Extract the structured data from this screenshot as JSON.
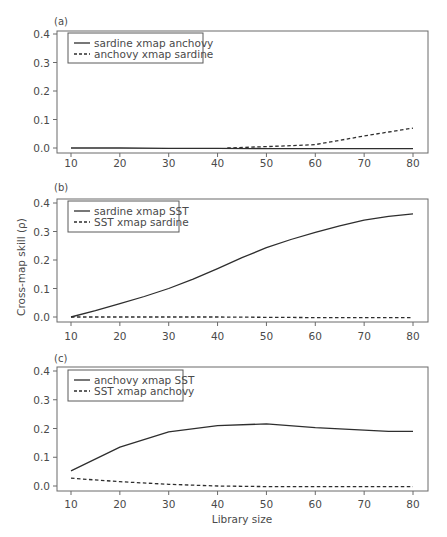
{
  "figure": {
    "ylabel": "Cross-map skill (ρ)",
    "xlabel": "Library size"
  },
  "colors": {
    "line": "#2e2e2e",
    "frame": "#6a6a6a",
    "text": "#4a4a4a"
  },
  "chart_data": [
    {
      "type": "line",
      "panel_label": "(a)",
      "title": "",
      "xlabel": "",
      "ylabel": "",
      "xlim": [
        10,
        80
      ],
      "ylim": [
        0,
        0.4
      ],
      "x_ticks": [
        10,
        20,
        30,
        40,
        50,
        60,
        70,
        80
      ],
      "y_ticks": [
        "0.0",
        "0.1",
        "0.2",
        "0.3",
        "0.4"
      ],
      "grid": false,
      "legend_position": "upper left",
      "series": [
        {
          "name": "sardine xmap anchovy",
          "style": "solid",
          "x": [
            10,
            20,
            30,
            40,
            50,
            60,
            70,
            80
          ],
          "y": [
            0.0,
            0.0,
            -0.001,
            -0.001,
            -0.002,
            -0.002,
            -0.002,
            -0.002
          ]
        },
        {
          "name": "anchovy xmap sardine",
          "style": "dashed",
          "x": [
            42,
            50,
            55,
            60,
            65,
            70,
            75,
            80
          ],
          "y": [
            0.0,
            0.005,
            0.008,
            0.012,
            0.027,
            0.042,
            0.056,
            0.07
          ]
        }
      ]
    },
    {
      "type": "line",
      "panel_label": "(b)",
      "title": "",
      "xlabel": "",
      "ylabel": "Cross-map skill (ρ)",
      "xlim": [
        10,
        80
      ],
      "ylim": [
        0,
        0.4
      ],
      "x_ticks": [
        10,
        20,
        30,
        40,
        50,
        60,
        70,
        80
      ],
      "y_ticks": [
        "0.0",
        "0.1",
        "0.2",
        "0.3",
        "0.4"
      ],
      "grid": false,
      "legend_position": "upper left",
      "series": [
        {
          "name": "sardine xmap SST",
          "style": "solid",
          "x": [
            10,
            15,
            20,
            25,
            30,
            35,
            40,
            45,
            50,
            55,
            60,
            65,
            70,
            75,
            80
          ],
          "y": [
            0.0,
            0.022,
            0.047,
            0.072,
            0.1,
            0.133,
            0.17,
            0.208,
            0.243,
            0.272,
            0.297,
            0.32,
            0.34,
            0.353,
            0.362
          ]
        },
        {
          "name": "SST xmap sardine",
          "style": "dashed",
          "x": [
            10,
            20,
            30,
            40,
            50,
            60,
            70,
            80
          ],
          "y": [
            0.0,
            0.0,
            0.0,
            0.0,
            -0.001,
            -0.002,
            -0.002,
            -0.002
          ]
        }
      ]
    },
    {
      "type": "line",
      "panel_label": "(c)",
      "title": "",
      "xlabel": "Library size",
      "ylabel": "",
      "xlim": [
        10,
        80
      ],
      "ylim": [
        0,
        0.4
      ],
      "x_ticks": [
        10,
        20,
        30,
        40,
        50,
        60,
        70,
        80
      ],
      "y_ticks": [
        "0.0",
        "0.1",
        "0.2",
        "0.3",
        "0.4"
      ],
      "grid": false,
      "legend_position": "upper left",
      "series": [
        {
          "name": "anchovy xmap SST",
          "style": "solid",
          "x": [
            10,
            20,
            30,
            40,
            50,
            60,
            70,
            75,
            80
          ],
          "y": [
            0.053,
            0.135,
            0.188,
            0.21,
            0.216,
            0.203,
            0.194,
            0.19,
            0.19
          ]
        },
        {
          "name": "SST xmap anchovy",
          "style": "dashed",
          "x": [
            10,
            20,
            30,
            40,
            50,
            60,
            70,
            80
          ],
          "y": [
            0.027,
            0.015,
            0.006,
            0.0,
            -0.002,
            -0.002,
            -0.002,
            -0.002
          ]
        }
      ]
    }
  ]
}
